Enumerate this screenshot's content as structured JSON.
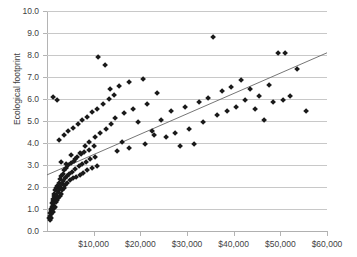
{
  "chart_data": {
    "type": "scatter",
    "title": "",
    "xlabel": "",
    "ylabel": "Ecological footprint",
    "xlim": [
      0,
      60000
    ],
    "ylim": [
      0,
      10
    ],
    "grid": true,
    "legend": false,
    "x_tick_labels": [
      "$10,000",
      "$20,000",
      "$30,000",
      "$40,000",
      "$50,000",
      "$60,000"
    ],
    "x_tick_values": [
      10000,
      20000,
      30000,
      40000,
      50000,
      60000
    ],
    "y_tick_labels": [
      "0.0",
      "1.0",
      "2.0",
      "3.0",
      "4.0",
      "5.0",
      "6.0",
      "7.0",
      "8.0",
      "9.0",
      "10.0"
    ],
    "y_tick_values": [
      0,
      1,
      2,
      3,
      4,
      5,
      6,
      7,
      8,
      9,
      10
    ],
    "marker": "diamond",
    "marker_color": "#1a1a1a",
    "trendline": {
      "type": "linear",
      "color": "#666666",
      "x_start": 0,
      "y_start": 2.55,
      "x_end": 60000,
      "y_end": 8.1
    },
    "points": [
      [
        500,
        0.6
      ],
      [
        600,
        0.7
      ],
      [
        700,
        0.5
      ],
      [
        750,
        0.8
      ],
      [
        800,
        0.9
      ],
      [
        850,
        0.6
      ],
      [
        900,
        1.0
      ],
      [
        950,
        0.75
      ],
      [
        1000,
        1.1
      ],
      [
        1050,
        0.9
      ],
      [
        1100,
        1.25
      ],
      [
        1150,
        1.0
      ],
      [
        1200,
        1.35
      ],
      [
        1250,
        1.15
      ],
      [
        1300,
        0.85
      ],
      [
        1350,
        1.45
      ],
      [
        1400,
        1.2
      ],
      [
        1450,
        1.6
      ],
      [
        1500,
        1.3
      ],
      [
        1550,
        1.05
      ],
      [
        1600,
        1.7
      ],
      [
        1650,
        1.4
      ],
      [
        1700,
        1.55
      ],
      [
        1750,
        1.1
      ],
      [
        1800,
        1.85
      ],
      [
        1850,
        1.5
      ],
      [
        1900,
        1.3
      ],
      [
        1950,
        1.95
      ],
      [
        2000,
        1.65
      ],
      [
        2100,
        1.4
      ],
      [
        2200,
        2.05
      ],
      [
        2300,
        1.75
      ],
      [
        2400,
        1.5
      ],
      [
        2500,
        2.2
      ],
      [
        2600,
        1.9
      ],
      [
        2700,
        1.6
      ],
      [
        2800,
        2.35
      ],
      [
        2900,
        2.0
      ],
      [
        3000,
        1.7
      ],
      [
        3100,
        2.5
      ],
      [
        3200,
        2.15
      ],
      [
        3300,
        1.85
      ],
      [
        3400,
        2.6
      ],
      [
        3500,
        2.25
      ],
      [
        3600,
        1.95
      ],
      [
        3700,
        2.75
      ],
      [
        3800,
        2.4
      ],
      [
        3900,
        2.1
      ],
      [
        4000,
        2.85
      ],
      [
        4200,
        2.5
      ],
      [
        4400,
        2.2
      ],
      [
        4600,
        3.0
      ],
      [
        4800,
        2.6
      ],
      [
        5000,
        2.3
      ],
      [
        5200,
        3.1
      ],
      [
        5400,
        2.7
      ],
      [
        5600,
        2.4
      ],
      [
        5800,
        3.2
      ],
      [
        6000,
        2.8
      ],
      [
        6200,
        2.45
      ],
      [
        6500,
        3.35
      ],
      [
        6800,
        2.95
      ],
      [
        7000,
        2.55
      ],
      [
        7200,
        3.5
      ],
      [
        7500,
        3.05
      ],
      [
        7800,
        2.65
      ],
      [
        8000,
        3.6
      ],
      [
        8300,
        3.15
      ],
      [
        8600,
        2.75
      ],
      [
        9000,
        3.7
      ],
      [
        9300,
        3.25
      ],
      [
        9600,
        2.85
      ],
      [
        10000,
        3.85
      ],
      [
        10400,
        3.35
      ],
      [
        10800,
        2.95
      ],
      [
        1200,
        6.1
      ],
      [
        2100,
        5.95
      ],
      [
        2600,
        4.15
      ],
      [
        3100,
        3.15
      ],
      [
        3600,
        4.35
      ],
      [
        4100,
        3.05
      ],
      [
        4600,
        4.55
      ],
      [
        5100,
        3.45
      ],
      [
        5600,
        4.7
      ],
      [
        6100,
        3.25
      ],
      [
        6600,
        4.85
      ],
      [
        7100,
        3.55
      ],
      [
        7600,
        5.05
      ],
      [
        8100,
        3.85
      ],
      [
        8600,
        5.2
      ],
      [
        9100,
        4.05
      ],
      [
        9600,
        5.4
      ],
      [
        10200,
        4.25
      ],
      [
        10800,
        5.55
      ],
      [
        11400,
        4.45
      ],
      [
        12000,
        5.75
      ],
      [
        12600,
        4.65
      ],
      [
        13200,
        6.0
      ],
      [
        13800,
        4.85
      ],
      [
        14400,
        6.2
      ],
      [
        11000,
        7.9
      ],
      [
        12500,
        7.55
      ],
      [
        13500,
        6.45
      ],
      [
        14500,
        5.15
      ],
      [
        15500,
        6.6
      ],
      [
        16500,
        5.35
      ],
      [
        17500,
        6.75
      ],
      [
        18500,
        5.55
      ],
      [
        19500,
        4.95
      ],
      [
        20500,
        6.9
      ],
      [
        21500,
        5.75
      ],
      [
        22500,
        4.55
      ],
      [
        23500,
        6.25
      ],
      [
        24500,
        5.05
      ],
      [
        25500,
        4.25
      ],
      [
        26500,
        5.45
      ],
      [
        27500,
        4.45
      ],
      [
        28500,
        3.85
      ],
      [
        29500,
        5.65
      ],
      [
        30500,
        4.65
      ],
      [
        31500,
        3.95
      ],
      [
        32500,
        5.85
      ],
      [
        33500,
        4.95
      ],
      [
        34500,
        6.05
      ],
      [
        35500,
        8.8
      ],
      [
        36500,
        5.25
      ],
      [
        37500,
        6.35
      ],
      [
        38500,
        5.45
      ],
      [
        39500,
        6.55
      ],
      [
        40500,
        5.65
      ],
      [
        41500,
        6.85
      ],
      [
        42500,
        5.95
      ],
      [
        43500,
        6.45
      ],
      [
        44500,
        5.55
      ],
      [
        45500,
        6.15
      ],
      [
        46500,
        5.05
      ],
      [
        47500,
        6.65
      ],
      [
        48500,
        5.85
      ],
      [
        49500,
        8.1
      ],
      [
        51000,
        8.1
      ],
      [
        50500,
        5.95
      ],
      [
        52000,
        6.15
      ],
      [
        53500,
        7.35
      ],
      [
        55500,
        5.45
      ],
      [
        15000,
        3.65
      ],
      [
        16000,
        4.05
      ],
      [
        17500,
        3.75
      ],
      [
        21000,
        3.95
      ],
      [
        23000,
        4.35
      ]
    ]
  }
}
